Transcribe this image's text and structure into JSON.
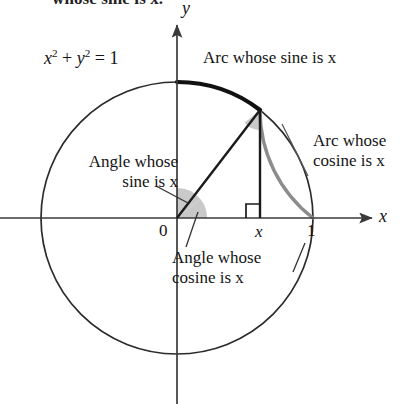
{
  "figure": {
    "clipped_headline": "whose sine is x.",
    "equation": {
      "base1": "x",
      "exp1": "2",
      "plus": " + ",
      "base2": "y",
      "exp2": "2",
      "rhs": " = 1"
    },
    "axes": {
      "y_label": "y",
      "x_label": "x",
      "origin_label": "0",
      "tick_x_label": "x",
      "tick_one_label": "1"
    },
    "annotations": {
      "arc_sine": "Arc whose sine is x",
      "arc_cosine_line1": "Arc whose",
      "arc_cosine_line2": "cosine is x",
      "angle_sine_line1": "Angle whose",
      "angle_sine_line2": "sine is x",
      "angle_cosine_line1": "Angle whose",
      "angle_cosine_line2": "cosine is x"
    },
    "colors": {
      "ink": "#141414",
      "circle_stroke": "#2b2b2b",
      "axis_stroke": "#3a3a3a",
      "highlight_arc_sine": "#111111",
      "highlight_arc_cosine": "#8c8c8c",
      "wedge_fill": "#c9c9c9",
      "background": "#ffffff"
    },
    "geometry": {
      "center_x": 177,
      "center_y": 218,
      "radius": 136,
      "point_x": 260,
      "point_y": 110,
      "x_axis_left": 0,
      "x_axis_right": 372,
      "y_axis_top": 25,
      "y_axis_bottom": 404,
      "right_angle_size": 14,
      "wedge_radius_origin": 30,
      "wedge_radius_vertex": 20
    }
  }
}
